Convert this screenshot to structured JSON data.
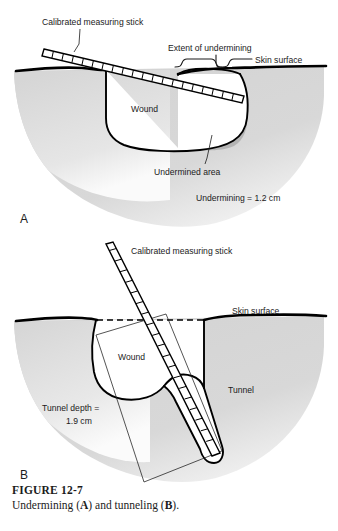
{
  "figure": {
    "number": "FIGURE 12-7",
    "caption_pre": "Undermining (",
    "caption_a": "A",
    "caption_mid": ") and tunneling (",
    "caption_b": "B",
    "caption_post": ")."
  },
  "panel_a": {
    "panel_label": "A",
    "labels": {
      "measuring_stick": "Calibrated measuring stick",
      "extent": "Extent of undermining",
      "skin_surface": "Skin surface",
      "wound": "Wound",
      "undermined_area": "Undermined area",
      "measurement": "Undermining = 1.2 cm"
    }
  },
  "panel_b": {
    "panel_label": "B",
    "labels": {
      "measuring_stick": "Calibrated measuring stick",
      "skin_surface": "Skin surface",
      "wound": "Wound",
      "tunnel": "Tunnel",
      "tunnel_depth_line1": "Tunnel depth =",
      "tunnel_depth_line2": "1.9 cm"
    }
  },
  "colors": {
    "tissue_fill": "#d6d6d6",
    "undermined_fill": "#b4b4b4",
    "wound_fill": "#ffffff",
    "outline": "#000000",
    "text": "#1b1b1b",
    "background": "#ffffff"
  }
}
